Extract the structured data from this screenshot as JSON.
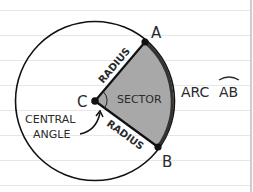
{
  "diagram": {
    "center_label": "C",
    "point_a_label": "A",
    "point_b_label": "B",
    "radius_label_top": "RADIUS",
    "radius_label_bottom": "RADIUS",
    "sector_label": "SECTOR",
    "arc_label": "ARC",
    "arc_name": "AB",
    "central_angle_line1": "CENTRAL",
    "central_angle_line2": "ANGLE"
  },
  "colors": {
    "paper": "#ffffff",
    "rule_line": "#e6e6e6",
    "margin_line": "#bdbdbd",
    "stroke": "#111111",
    "sector_fill": "#a8a8a8",
    "arc_stroke": "#333333"
  }
}
